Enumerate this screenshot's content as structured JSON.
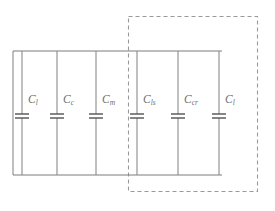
{
  "diagram": {
    "type": "electrical-circuit-schematic",
    "line_color": "#7d7d7d",
    "plate_color": "#5d5d5d",
    "dashed_box_color": "#9a9a9a",
    "background_color": "#ffffff",
    "rails": {
      "top_y": 51,
      "bottom_y": 175,
      "left_x": 13,
      "right_x": 222
    },
    "dashed_region": {
      "label": "",
      "x": 128,
      "y": 16,
      "width": 130,
      "height": 176,
      "encloses": [
        "C_ls",
        "C_cr",
        "C_l"
      ]
    },
    "capacitors": [
      {
        "id": "C1",
        "symbol": "C",
        "subscript": "l",
        "x": 22,
        "label_dx": 6,
        "label_dy": -22,
        "inside_dashed_box": false
      },
      {
        "id": "C2",
        "symbol": "C",
        "subscript": "c",
        "x": 57,
        "label_dx": 6,
        "label_dy": -22,
        "inside_dashed_box": false
      },
      {
        "id": "C3",
        "symbol": "C",
        "subscript": "m",
        "x": 96,
        "label_dx": 6,
        "label_dy": -22,
        "inside_dashed_box": false
      },
      {
        "id": "C4",
        "symbol": "C",
        "subscript": "ls",
        "x": 137,
        "label_dx": 6,
        "label_dy": -22,
        "inside_dashed_box": true
      },
      {
        "id": "C5",
        "symbol": "C",
        "subscript": "cr",
        "x": 178,
        "label_dx": 6,
        "label_dy": -22,
        "inside_dashed_box": true
      },
      {
        "id": "C6",
        "symbol": "C",
        "subscript": "l",
        "x": 219,
        "label_dx": 6,
        "label_dy": -22,
        "inside_dashed_box": true
      }
    ],
    "capacitor_symbol": {
      "plate_half_width": 7,
      "plate_gap": 4,
      "center_y": 116
    }
  }
}
